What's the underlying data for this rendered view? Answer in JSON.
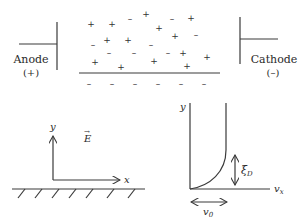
{
  "figure": {
    "top_panel": {
      "anode": {
        "label": "Anode",
        "sign": "(+)"
      },
      "cathode": {
        "label": "Cathode",
        "sign": "(–)"
      },
      "charges": [
        {
          "s": "+",
          "x": 91,
          "y": 24
        },
        {
          "s": "+",
          "x": 112,
          "y": 24
        },
        {
          "s": "–",
          "x": 130,
          "y": 19
        },
        {
          "s": "+",
          "x": 146,
          "y": 14
        },
        {
          "s": "+",
          "x": 159,
          "y": 28
        },
        {
          "s": "–",
          "x": 172,
          "y": 19
        },
        {
          "s": "+",
          "x": 191,
          "y": 18
        },
        {
          "s": "+",
          "x": 107,
          "y": 40
        },
        {
          "s": "+",
          "x": 128,
          "y": 40
        },
        {
          "s": "+",
          "x": 175,
          "y": 36
        },
        {
          "s": "–",
          "x": 196,
          "y": 35
        },
        {
          "s": "–",
          "x": 93,
          "y": 45
        },
        {
          "s": "–",
          "x": 151,
          "y": 45
        },
        {
          "s": "–",
          "x": 109,
          "y": 53
        },
        {
          "s": "–",
          "x": 134,
          "y": 53
        },
        {
          "s": "–",
          "x": 168,
          "y": 53
        },
        {
          "s": "+",
          "x": 183,
          "y": 53
        },
        {
          "s": "+",
          "x": 207,
          "y": 57
        },
        {
          "s": "+",
          "x": 95,
          "y": 62
        },
        {
          "s": "+",
          "x": 121,
          "y": 67
        },
        {
          "s": "+",
          "x": 154,
          "y": 61
        },
        {
          "s": "+",
          "x": 187,
          "y": 66
        }
      ],
      "surface_charges": [
        "–",
        "–",
        "–",
        "–",
        "–",
        "–"
      ]
    },
    "bottom_left": {
      "y_label": "y",
      "x_label": "x",
      "field_label": "E",
      "field_arrow": "→"
    },
    "bottom_right": {
      "y_label": "y",
      "x_label": "v",
      "x_sub": "x",
      "debye_label": "ξ",
      "debye_sub": "D",
      "slip_label": "v",
      "slip_sub": "0"
    }
  }
}
